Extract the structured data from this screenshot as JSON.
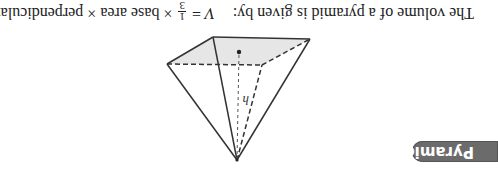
{
  "badge": {
    "label": "Pyramids",
    "color": "#6b6b6b"
  },
  "figure": {
    "height_label": "h",
    "base_fill": "#e6e6e6",
    "line_color": "#333333"
  },
  "formula": {
    "intro": "The volume of a pyramid is given by:",
    "lhs": "V",
    "equals": "=",
    "numerator": "1",
    "denominator": "3",
    "times1": "×",
    "term1": "base area",
    "times2": "×",
    "term2": "perpendicular height"
  }
}
